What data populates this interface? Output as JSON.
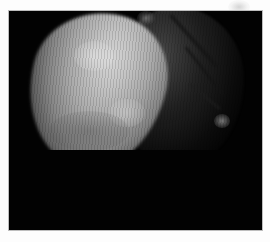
{
  "image": {
    "description": "Grayscale image of an irregular bright spherical body against a black background, with a shadowed textured region on its right side",
    "colors": {
      "background_page": "#fdfdfd",
      "frame": "#020202",
      "lit_surface": "#c4c4c4",
      "shadow_surface": "#3c3c3c"
    }
  }
}
